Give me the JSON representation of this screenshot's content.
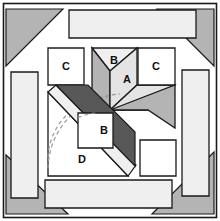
{
  "figure": {
    "canvas": {
      "width": 220,
      "height": 221
    },
    "colors": {
      "background": "#ffffff",
      "outline": "#1a1a1a",
      "white_patch": "#ffffff",
      "pale_gray": "#efefef",
      "light_gray": "#e4e4e4",
      "medium_gray": "#b4b4b4",
      "dark_gray": "#868686",
      "darkest_gray": "#585858",
      "dashed_arc": "#9a9a9a"
    },
    "outer_frame": {
      "name": "block-border",
      "x": 3,
      "y": 3,
      "width": 214,
      "height": 215,
      "stroke": "#1a1a1a",
      "fill": "#ffffff"
    },
    "corner_triangles": [
      {
        "name": "corner-triangle-top-left",
        "points": "6,9 63,9 6,66",
        "fill": "#b4b4b4"
      },
      {
        "name": "corner-triangle-top-right",
        "points": "214,9 214,66 157,9",
        "fill": "#b4b4b4"
      },
      {
        "name": "corner-triangle-bottom-left",
        "points": "6,155 6,214 68,214",
        "fill": "#b4b4b4"
      },
      {
        "name": "corner-triangle-bottom-right",
        "points": "214,152 214,214 152,214",
        "fill": "#b4b4b4"
      }
    ],
    "border_strips": [
      {
        "name": "border-strip-top",
        "points": "69,10 196,10 196,38 69,38",
        "fill": "#efefef"
      },
      {
        "name": "border-strip-left",
        "points": "11,72 38,72 38,198 11,198",
        "fill": "#efefef"
      },
      {
        "name": "border-strip-right",
        "points": "182,70 209,70 209,196 182,196",
        "fill": "#efefef"
      },
      {
        "name": "border-strip-bottom",
        "points": "45,180 172,180 172,208 45,208",
        "fill": "#efefef"
      }
    ],
    "patches": [
      {
        "name": "patch-c-left",
        "label": "C",
        "label_x": 66,
        "label_y": 66,
        "shape": "square",
        "points": "48,48 84,48 84,85 48,85",
        "fill": "#ffffff"
      },
      {
        "name": "patch-c-right",
        "label": "C",
        "label_x": 156,
        "label_y": 67,
        "shape": "square",
        "points": "138,48 175,48 175,85 138,85",
        "fill": "#ffffff"
      },
      {
        "name": "patch-unlabeled-square",
        "label": "",
        "shape": "square",
        "points": "140,140 176,140 176,176 140,176",
        "fill": "#ffffff"
      },
      {
        "name": "patch-a-center",
        "label": "A",
        "label_x": 127,
        "label_y": 80,
        "shape": "rhombus",
        "points": "110,71 137,48 137,85 110,110",
        "fill": "#e4e4e4"
      },
      {
        "name": "patch-b-top",
        "label": "B",
        "label_x": 114,
        "label_y": 60,
        "shape": "triangle",
        "points": "92,48 137,48 110,71",
        "fill": "#efefef"
      },
      {
        "name": "patch-left-dark-wedge",
        "label": "",
        "shape": "quad",
        "points": "92,48 110,71 110,110 92,92",
        "fill": "#b4b4b4"
      },
      {
        "name": "patch-lower-right-wedge",
        "label": "",
        "shape": "quad",
        "points": "110,110 137,85 175,85 148,110",
        "fill": "#e4e4e4"
      },
      {
        "name": "patch-lower-right-dark",
        "label": "",
        "shape": "triangle",
        "points": "110,110 148,110 175,85 175,128",
        "fill": "#b4b4b4"
      },
      {
        "name": "patch-sash-diagonal-dark",
        "label": "",
        "shape": "band",
        "points": "56,88 88,88 135,135 113,158",
        "fill": "#585858"
      },
      {
        "name": "patch-b-small",
        "label": "B",
        "label_x": 105,
        "label_y": 131,
        "shape": "quad",
        "points": "78,113 113,113 113,148 78,148",
        "fill": "#ffffff"
      },
      {
        "name": "patch-d-triangle",
        "label": "D",
        "label_x": 82,
        "label_y": 160,
        "shape": "triangle",
        "points": "48,92 48,176 128,176",
        "fill": "#ffffff"
      },
      {
        "name": "patch-sash-light-stripe",
        "label": "",
        "shape": "band",
        "points": "48,92 56,88 136,168 128,176",
        "fill": "#efefef"
      }
    ],
    "dashed_arcs": [
      {
        "name": "dashed-arc-outer",
        "d": "M 48,166 A 74,74 0 0 1 118,92",
        "stroke": "#9a9a9a"
      },
      {
        "name": "dashed-arc-inner",
        "d": "M 48,156 A 62,62 0 0 1 108,96",
        "stroke": "#9a9a9a"
      }
    ],
    "labels": {
      "a": "A",
      "b": "B",
      "c": "C",
      "d": "D"
    }
  }
}
